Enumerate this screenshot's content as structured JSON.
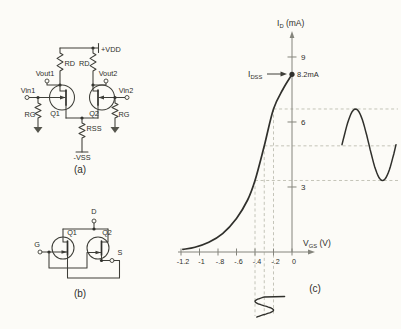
{
  "palette": {
    "paper": "#fcfbf7",
    "ink": "#30302c",
    "circuit": "#3e3e38",
    "axis": "#84847c",
    "dash": "#bdbdb1"
  },
  "circuit_a": {
    "caption": "(a)",
    "vdd": "+VDD",
    "vss": "-VSS",
    "rd_left": "RD",
    "rd_right": "RD",
    "rg_left": "RG",
    "rg_right": "RG",
    "rss": "RSS",
    "vout1": "Vout1",
    "vout2": "Vout2",
    "vin1": "Vin1",
    "vin2": "Vin2",
    "q1": "Q1",
    "q2": "Q2"
  },
  "circuit_b": {
    "caption": "(b)",
    "drain": "D",
    "gate": "G",
    "source": "S",
    "q1": "Q1",
    "q2": "Q2"
  },
  "graph_labels": {
    "caption": "(c)",
    "y_title_base": "I",
    "y_title_sub": "D",
    "y_title_rest": " (mA)",
    "x_title_base": "V",
    "x_title_sub": "GS",
    "x_title_rest": " (V)",
    "idss_base": "I",
    "idss_sub": "DSS"
  },
  "chart_data": {
    "type": "line",
    "title": "",
    "xlabel": "VGS (V)",
    "ylabel": "ID (mA)",
    "xlim": [
      -1.3,
      0.22
    ],
    "ylim": [
      0,
      10.2
    ],
    "grid": false,
    "legend": null,
    "x_ticks": [
      {
        "v": -1.2,
        "label": "-1.2"
      },
      {
        "v": -1.0,
        "label": "-1"
      },
      {
        "v": -0.8,
        "label": "-.8"
      },
      {
        "v": -0.6,
        "label": "-.6"
      },
      {
        "v": -0.4,
        "label": "-.4"
      },
      {
        "v": -0.2,
        "label": "-.2"
      },
      {
        "v": 0,
        "label": "0"
      }
    ],
    "y_ticks": [
      {
        "v": 3,
        "label": "3"
      },
      {
        "v": 6,
        "label": "6"
      },
      {
        "v": 9,
        "label": "9"
      }
    ],
    "series": [
      {
        "name": "ID vs VGS transfer curve",
        "x": [
          -1.18,
          -1.05,
          -0.9,
          -0.75,
          -0.6,
          -0.48,
          -0.4,
          -0.3,
          -0.2,
          -0.1,
          0
        ],
        "y": [
          0.12,
          0.22,
          0.45,
          0.85,
          1.55,
          2.4,
          3.3,
          4.9,
          6.6,
          7.5,
          8.2
        ]
      }
    ],
    "annotations": [
      {
        "label": "IDSS",
        "value_label": "8.2mA",
        "x": 0,
        "y": 8.2
      }
    ],
    "overlays": {
      "vgs_dashed": [
        -0.4,
        -0.3,
        -0.2
      ],
      "id_dashed": [
        3.3,
        4.9,
        6.6
      ],
      "input_sine": {
        "center_vgs": -0.3,
        "amplitude_vgs": 0.1
      },
      "output_sine": {
        "center_id": 4.95,
        "amplitude_id": 1.65
      }
    }
  }
}
